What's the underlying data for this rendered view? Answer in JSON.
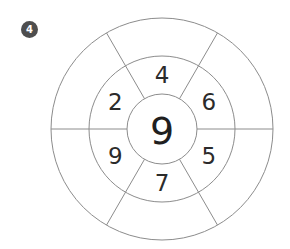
{
  "badge": {
    "label": "4",
    "color": "#4e4e4e"
  },
  "wheel": {
    "center_value": "9",
    "middle_ring": [
      {
        "position": "top",
        "value": "4"
      },
      {
        "position": "upper-right",
        "value": "6"
      },
      {
        "position": "lower-right",
        "value": "5"
      },
      {
        "position": "bottom",
        "value": "7"
      },
      {
        "position": "lower-left",
        "value": "9"
      },
      {
        "position": "upper-left",
        "value": "2"
      }
    ],
    "outer_ring": [
      {
        "position": "top",
        "value": ""
      },
      {
        "position": "upper-right",
        "value": ""
      },
      {
        "position": "lower-right",
        "value": ""
      },
      {
        "position": "bottom",
        "value": ""
      },
      {
        "position": "lower-left",
        "value": ""
      },
      {
        "position": "upper-left",
        "value": ""
      }
    ],
    "sector_count": 6
  },
  "colors": {
    "line": "#8c8c8c",
    "number_text": "#2b2b2b",
    "background": "#ffffff"
  }
}
